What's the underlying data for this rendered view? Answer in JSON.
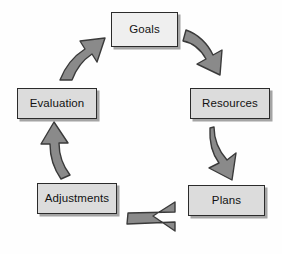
{
  "diagram": {
    "type": "cycle",
    "direction": "clockwise",
    "background_color": "#fefefe",
    "node_fill_color": "#dcdcdc",
    "node_fill_color_light": "#efefef",
    "node_border_color": "#2b2b2b",
    "arrow_fill_color": "#8a8a8a",
    "arrow_stroke_color": "#3a3a3a",
    "nodes": [
      {
        "id": "goals",
        "label": "Goals"
      },
      {
        "id": "resources",
        "label": "Resources"
      },
      {
        "id": "plans",
        "label": "Plans"
      },
      {
        "id": "adjustments",
        "label": "Adjustments"
      },
      {
        "id": "evaluation",
        "label": "Evaluation"
      }
    ],
    "arrows": [
      {
        "id": "goals-to-resources",
        "from": "Goals",
        "to": "Resources",
        "direction": "down-right"
      },
      {
        "id": "resources-to-plans",
        "from": "Resources",
        "to": "Plans",
        "direction": "down"
      },
      {
        "id": "plans-to-adjustments",
        "from": "Plans",
        "to": "Adjustments",
        "direction": "left"
      },
      {
        "id": "adjustments-to-evaluation",
        "from": "Adjustments",
        "to": "Evaluation",
        "direction": "up"
      },
      {
        "id": "evaluation-to-goals",
        "from": "Evaluation",
        "to": "Goals",
        "direction": "up-right"
      }
    ]
  }
}
